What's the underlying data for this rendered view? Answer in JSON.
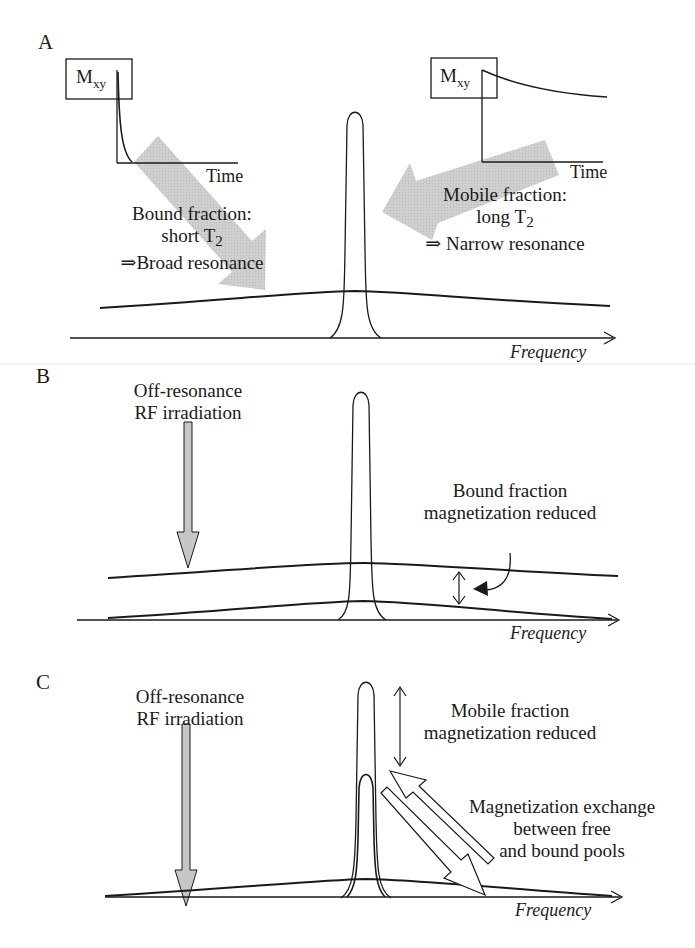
{
  "figure": {
    "panels": [
      {
        "id": "A",
        "letter": "A",
        "left_inset": {
          "axis_label": "M",
          "axis_sub": "xy",
          "x_label": "Time",
          "decay": "fast"
        },
        "right_inset": {
          "axis_label": "M",
          "axis_sub": "xy",
          "x_label": "Time",
          "decay": "slow"
        },
        "bound_text": {
          "line1": "Bound fraction:",
          "line2_pre": "short T",
          "line2_sub": "2",
          "line3": "⇒Broad resonance"
        },
        "mobile_text": {
          "line1": "Mobile fraction:",
          "line2_pre": "long T",
          "line2_sub": "2",
          "line3": "⇒ Narrow resonance"
        },
        "x_axis_label": "Frequency"
      },
      {
        "id": "B",
        "letter": "B",
        "rf_text": {
          "line1": "Off-resonance",
          "line2": "RF irradiation"
        },
        "annotation": {
          "line1": "Bound fraction",
          "line2": "magnetization reduced"
        },
        "x_axis_label": "Frequency"
      },
      {
        "id": "C",
        "letter": "C",
        "rf_text": {
          "line1": "Off-resonance",
          "line2": "RF irradiation"
        },
        "mobile_annotation": {
          "line1": "Mobile fraction",
          "line2": "magnetization reduced"
        },
        "exchange_annotation": {
          "line1": "Magnetization exchange",
          "line2": "between free",
          "line3": "and bound pools"
        },
        "x_axis_label": "Frequency"
      }
    ],
    "colors": {
      "ink": "#1a1a1a",
      "arrow_fill": "#c8c8c8",
      "arrow_fill_light": "#d4d4d4"
    }
  }
}
